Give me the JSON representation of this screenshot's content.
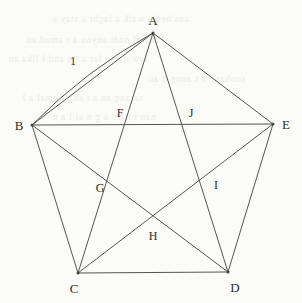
{
  "figure": {
    "kind": "geometry-diagram",
    "background_color": "#fbfbf8",
    "stroke_color": "#43423f",
    "label_color": "#2e2e2c",
    "stroke_width": 0.9,
    "width": 302,
    "height": 303
  },
  "vertices": [
    {
      "id": "A",
      "label": "A",
      "x": 153,
      "y": 33,
      "label_x": 153,
      "label_y": 20
    },
    {
      "id": "B",
      "label": "B",
      "x": 32,
      "y": 125,
      "label_x": 19,
      "label_y": 125
    },
    {
      "id": "C",
      "label": "C",
      "x": 78,
      "y": 273,
      "label_x": 74,
      "label_y": 288
    },
    {
      "id": "D",
      "label": "D",
      "x": 228,
      "y": 272,
      "label_x": 235,
      "label_y": 287
    },
    {
      "id": "E",
      "label": "E",
      "x": 273,
      "y": 124,
      "label_x": 286,
      "label_y": 124
    }
  ],
  "intersections": [
    {
      "id": "F",
      "label": "F",
      "x": 127,
      "y": 125,
      "label_x": 120,
      "label_y": 113
    },
    {
      "id": "G",
      "label": "G",
      "x": 108,
      "y": 188,
      "label_x": 100,
      "label_y": 188
    },
    {
      "id": "H",
      "label": "H",
      "x": 153,
      "y": 222,
      "label_x": 153,
      "label_y": 236
    },
    {
      "id": "I",
      "label": "I",
      "x": 208,
      "y": 185,
      "label_x": 216,
      "label_y": 185
    },
    {
      "id": "J",
      "label": "J",
      "x": 192,
      "y": 125,
      "label_x": 191,
      "label_y": 113
    }
  ],
  "sides": [
    {
      "id": "AB",
      "from": "A",
      "to": "B"
    },
    {
      "id": "BC",
      "from": "B",
      "to": "C"
    },
    {
      "id": "CD",
      "from": "C",
      "to": "D"
    },
    {
      "id": "DE",
      "from": "D",
      "to": "E"
    },
    {
      "id": "EA",
      "from": "E",
      "to": "A"
    }
  ],
  "diagonals": [
    {
      "id": "AC",
      "from": "A",
      "to": "C"
    },
    {
      "id": "AD",
      "from": "A",
      "to": "D"
    },
    {
      "id": "BD",
      "from": "B",
      "to": "D"
    },
    {
      "id": "BE",
      "from": "B",
      "to": "E"
    },
    {
      "id": "CE",
      "from": "C",
      "to": "E"
    }
  ],
  "overdrawn_edge": {
    "id": "AB-arc",
    "note": "side AB is drawn a second time as a slightly bowed stroke",
    "path": "M 32 125 Q 86 70 153 33"
  },
  "measure_labels": [
    {
      "id": "side-length",
      "text": "1",
      "x": 73,
      "y": 62,
      "refers_to": "AB"
    }
  ],
  "ghost_text": {
    "note": "faint bleed-through text from the reverse of the scanned page",
    "lines": [
      {
        "text": "aus bed a walk  a laghi a stay a",
        "x": 52,
        "y": 14
      },
      {
        "text": "curral nadi anyon a  t amed  an",
        "x": 26,
        "y": 35
      },
      {
        "text": "law a han lar a t a  and l lika  an",
        "x": 8,
        "y": 54
      },
      {
        "text": "sunhand e t anng d an",
        "x": 148,
        "y": 74
      },
      {
        "text": "sarang an a t eng t emal  a  l",
        "x": 22,
        "y": 93
      },
      {
        "text": "nan t  ha  n a g n    al l a n",
        "x": 52,
        "y": 112
      }
    ]
  }
}
